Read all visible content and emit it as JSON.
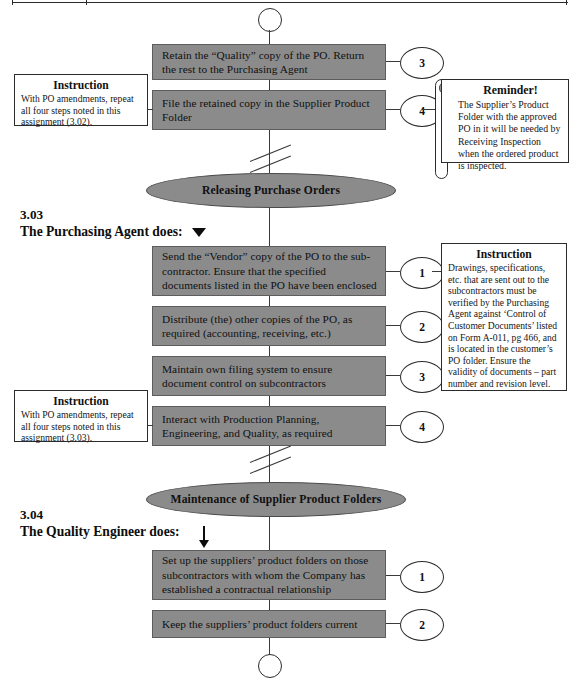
{
  "document": {
    "title": "Purchasing / Supplier Product Folder Procedure Flowchart",
    "accent_gray": "#8b8b8b",
    "line_color": "#3a3a3a"
  },
  "terminators": {
    "top": "connector-circle",
    "bottom": "connector-circle"
  },
  "section_302_tail": {
    "steps": [
      {
        "number": "3",
        "text": "Retain the “Quality” copy of the PO. Return the rest to the Purchasing Agent"
      },
      {
        "number": "4",
        "text": "File the retained copy in the Supplier Product Folder"
      }
    ],
    "note": {
      "title": "Instruction",
      "body": "With PO amendments, repeat all four steps noted in this assignment (3.02)."
    },
    "reminder": {
      "title": "Reminder!",
      "body": "The Supplier’s Product Folder with the approved PO in it will be needed by Receiving Inspection when the ordered product is inspected."
    }
  },
  "stage_1": {
    "label": "Releasing Purchase Orders"
  },
  "section_303": {
    "number": "3.03",
    "title": "The Purchasing Agent does:",
    "steps": [
      {
        "number": "1",
        "text": "Send the “Vendor” copy of the PO to the sub-contractor. Ensure that the specified documents listed in the PO have been enclosed"
      },
      {
        "number": "2",
        "text": "Distribute (the) other copies of the PO, as required (accounting, receiving, etc.)"
      },
      {
        "number": "3",
        "text": "Maintain own filing system to ensure document control on subcontractors"
      },
      {
        "number": "4",
        "text": "Interact with Production Planning, Engineering, and Quality, as required"
      }
    ],
    "note_left": {
      "title": "Instruction",
      "body": "With PO amendments, repeat all four steps noted in this assignment (3.03)."
    },
    "note_right": {
      "title": "Instruction",
      "body": "Drawings, specifications, etc. that are sent out to the subcontractors must be verified by the Purchasing Agent against  ‘Control of Customer Documents’ listed on Form A-011, pg 466, and is located in the customer’s PO  folder. Ensure the validity of documents –  part number and revision level."
    }
  },
  "stage_2": {
    "label": "Maintenance of Supplier Product Folders"
  },
  "section_304": {
    "number": "3.04",
    "title": "The Quality Engineer does:",
    "steps": [
      {
        "number": "1",
        "text": "Set up the suppliers’ product folders on those subcontractors with whom the Company has established a contractual relationship"
      },
      {
        "number": "2",
        "text": "Keep the suppliers’ product folders current"
      }
    ]
  }
}
